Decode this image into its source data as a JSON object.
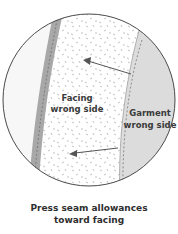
{
  "diagram": {
    "labels": {
      "facing_line1": "Facing",
      "facing_line2": "wrong side",
      "garment_line1": "Garment",
      "garment_line2": "wrong side"
    },
    "caption": {
      "line1": "Press seam allowances",
      "line2": "toward facing"
    },
    "colors": {
      "outline": "#4a4a4a",
      "left_area": "#f7f7f7",
      "facing_strip": "#a8a8a8",
      "facing_body": "#ffffff",
      "garment": "#dcdcdc",
      "arrow": "#555555",
      "speckle": "#9a9a9a"
    }
  }
}
